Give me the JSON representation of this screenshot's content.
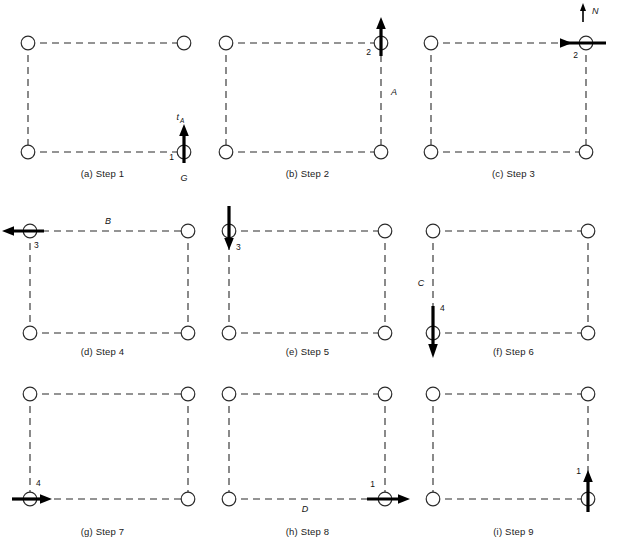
{
  "figure": {
    "type": "diagram",
    "columns": 3,
    "rows": 3,
    "node_count_per_panel": 4,
    "edge_style": "dashed",
    "node_style": "open-circle",
    "stroke_color": "#2b2b2b",
    "arrow_color": "#000000",
    "background": "#ffffff",
    "bottom_artifact_text": "                                                                                                           "
  },
  "panels": [
    {
      "id": "panel-a",
      "caption": "(a) Step 1",
      "edges": [
        "top",
        "left",
        "bottom"
      ],
      "arrow": {
        "node": "bottom-right",
        "direction": "up",
        "number": "1",
        "number_side": "left"
      },
      "labels": {
        "force_top": "t",
        "force_top_sub": "A",
        "force_bottom": "G",
        "edge_label": "",
        "edge_label_pos": ""
      }
    },
    {
      "id": "panel-b",
      "caption": "(b) Step 2",
      "edges": [
        "top",
        "left",
        "bottom",
        "right"
      ],
      "arrow": {
        "node": "top-right",
        "direction": "up",
        "number": "2",
        "number_side": "left"
      },
      "labels": {
        "force_top": "",
        "force_top_sub": "",
        "force_bottom": "",
        "edge_label": "A",
        "edge_label_pos": "right"
      }
    },
    {
      "id": "panel-c",
      "caption": "(c) Step 3",
      "edges": [
        "top",
        "left",
        "bottom",
        "right"
      ],
      "arrow": {
        "node": "top-right",
        "direction": "right",
        "number": "2",
        "number_side": "below-left"
      },
      "labels": {
        "force_top": "N",
        "force_top_sub": "",
        "force_bottom": "",
        "edge_label": "",
        "edge_label_pos": ""
      },
      "north_marker": "N"
    },
    {
      "id": "panel-d",
      "caption": "(d) Step 4",
      "edges": [
        "top",
        "left",
        "bottom",
        "right"
      ],
      "arrow": {
        "node": "top-left",
        "direction": "left",
        "number": "3",
        "number_side": "below-right"
      },
      "labels": {
        "force_top": "",
        "force_top_sub": "",
        "force_bottom": "",
        "edge_label": "B",
        "edge_label_pos": "top"
      }
    },
    {
      "id": "panel-e",
      "caption": "(e) Step 5",
      "edges": [
        "top",
        "left",
        "bottom",
        "right"
      ],
      "arrow": {
        "node": "top-left",
        "direction": "down",
        "number": "3",
        "number_side": "below-right"
      },
      "labels": {
        "force_top": "",
        "force_top_sub": "",
        "force_bottom": "",
        "edge_label": "",
        "edge_label_pos": ""
      }
    },
    {
      "id": "panel-f",
      "caption": "(f) Step 6",
      "edges": [
        "top",
        "left",
        "bottom",
        "right"
      ],
      "arrow": {
        "node": "bottom-left",
        "direction": "down",
        "number": "4",
        "number_side": "above-right"
      },
      "labels": {
        "force_top": "",
        "force_top_sub": "",
        "force_bottom": "",
        "edge_label": "C",
        "edge_label_pos": "left"
      }
    },
    {
      "id": "panel-g",
      "caption": "(g) Step 7",
      "edges": [
        "top",
        "left",
        "bottom",
        "right"
      ],
      "arrow": {
        "node": "bottom-left",
        "direction": "right",
        "number": "4",
        "number_side": "above-right"
      },
      "labels": {
        "force_top": "",
        "force_top_sub": "",
        "force_bottom": "",
        "edge_label": "",
        "edge_label_pos": ""
      }
    },
    {
      "id": "panel-h",
      "caption": "(h) Step 8",
      "edges": [
        "top",
        "left",
        "bottom",
        "right"
      ],
      "arrow": {
        "node": "bottom-right",
        "direction": "right",
        "number": "1",
        "number_side": "above-left"
      },
      "labels": {
        "force_top": "",
        "force_top_sub": "",
        "force_bottom": "",
        "edge_label": "D",
        "edge_label_pos": "bottom"
      }
    },
    {
      "id": "panel-i",
      "caption": "(i) Step 9",
      "edges": [
        "top",
        "left",
        "bottom",
        "right"
      ],
      "arrow": {
        "node": "bottom-right",
        "direction": "up",
        "number": "1",
        "number_side": "above-left"
      },
      "labels": {
        "force_top": "",
        "force_top_sub": "",
        "force_bottom": "",
        "edge_label": "",
        "edge_label_pos": ""
      }
    }
  ]
}
